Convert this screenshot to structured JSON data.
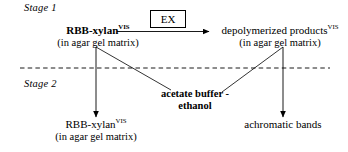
{
  "figure": {
    "type": "process-flow-diagram",
    "stages": [
      {
        "label": "Stage 1"
      },
      {
        "label": "Stage 2"
      }
    ],
    "nodes": {
      "substrate_top": {
        "main": "RBB-xylan",
        "superscript": "VIS",
        "sub": "(in agar gel matrix)"
      },
      "products_top": {
        "main": "depolymerized products",
        "superscript": "VIS",
        "sub": "(in agar gel matrix)"
      },
      "substrate_bottom": {
        "main": "RBB-xylan",
        "superscript": "VIS",
        "sub": "(in agar gel matrix)"
      },
      "bands_bottom": {
        "main": "achromatic bands",
        "superscript": "",
        "sub": ""
      }
    },
    "enzyme_box": {
      "label": "EX"
    },
    "reagent": {
      "line1": "acetate buffer -",
      "line2": "ethanol"
    },
    "colors": {
      "stroke": "#000000",
      "background": "#ffffff",
      "divider": "#000000"
    }
  }
}
